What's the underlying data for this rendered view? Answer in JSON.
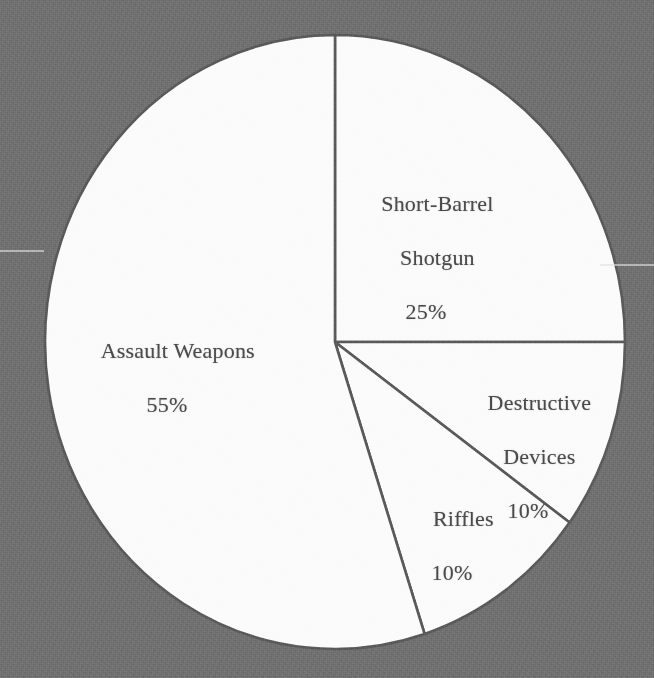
{
  "chart_data": {
    "type": "pie",
    "title": "",
    "subtitle": "",
    "xlabel": "",
    "ylabel": "",
    "legend": "none",
    "grid": false,
    "units": "percent",
    "start_angle_deg": 0,
    "direction": "clockwise",
    "categories": [
      "Short-Barrel Shotgun",
      "Destructive Devices",
      "Riffles",
      "Assault Weapons"
    ],
    "values": [
      25,
      10,
      10,
      55
    ],
    "slices": [
      {
        "label": "Short-Barrel Shotgun",
        "label_line1": "Short-Barrel",
        "label_line2": "Shotgun",
        "value": 25,
        "percent_text": "25%",
        "start_deg": 0,
        "end_deg": 90,
        "fill": "#fbfbfb",
        "stroke": "#5a5a5a"
      },
      {
        "label": "Destructive Devices",
        "label_line1": "Destructive",
        "label_line2": "Devices",
        "value": 10,
        "percent_text": "10%",
        "start_deg": 90,
        "end_deg": 126,
        "fill": "#fbfbfb",
        "stroke": "#5a5a5a"
      },
      {
        "label": "Riffles",
        "label_line1": "Riffles",
        "label_line2": "",
        "value": 10,
        "percent_text": "10%",
        "start_deg": 126,
        "end_deg": 162,
        "fill": "#fbfbfb",
        "stroke": "#5a5a5a"
      },
      {
        "label": "Assault Weapons",
        "label_line1": "Assault Weapons",
        "label_line2": "",
        "value": 55,
        "percent_text": "55%",
        "start_deg": 162,
        "end_deg": 360,
        "fill": "#fbfbfb",
        "stroke": "#5a5a5a"
      }
    ]
  },
  "geometry": {
    "center_x": 335,
    "center_y": 342,
    "radius_x": 290,
    "radius_y": 307
  },
  "colors": {
    "background": "#717171",
    "pie_fill": "#fbfbfb",
    "slice_border": "#5a5a5a",
    "text": "#4b4b4b"
  },
  "labels": {
    "short_barrel_shotgun": {
      "line1": "Short-Barrel",
      "line2": "Shotgun",
      "percent": "25%"
    },
    "assault_weapons": {
      "line1": "Assault Weapons",
      "percent": "55%"
    },
    "destructive_devices": {
      "line1": "Destructive",
      "line2": "Devices",
      "percent": "10%"
    },
    "riffles": {
      "line1": "Riffles",
      "percent": "10%"
    }
  }
}
